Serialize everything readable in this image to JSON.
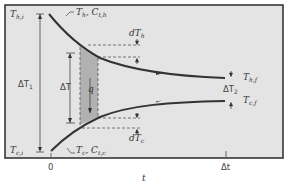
{
  "diagram": {
    "type": "heat-exchanger-temperature-profile",
    "labels": {
      "T_hi": {
        "base": "T",
        "sub": "h,i"
      },
      "T_ci": {
        "base": "T",
        "sub": "c,i"
      },
      "T_hf": {
        "base": "T",
        "sub": "h,f"
      },
      "T_cf": {
        "base": "T",
        "sub": "c,f"
      },
      "hot_curve": {
        "text": "T",
        "sub1": "h",
        "mid": ", C",
        "sub2": "t,h"
      },
      "cold_curve": {
        "text": "T",
        "sub1": "c",
        "mid": ", C",
        "sub2": "t,c"
      },
      "dT_h": {
        "base": "dT",
        "sub": "h"
      },
      "dT_c": {
        "base": "dT",
        "sub": "c"
      },
      "delta_T1": {
        "base": "ΔT",
        "sub": "1"
      },
      "delta_T2": {
        "base": "ΔT",
        "sub": "2"
      },
      "delta_T": "ΔT",
      "q": "q",
      "x_origin": "0",
      "x_end": "Δt",
      "x_axis": "t"
    },
    "colors": {
      "background": "#e4e4e4",
      "frame": "#2a2a2a",
      "curve": "#333333",
      "shaded": "#a8a8a8"
    }
  }
}
